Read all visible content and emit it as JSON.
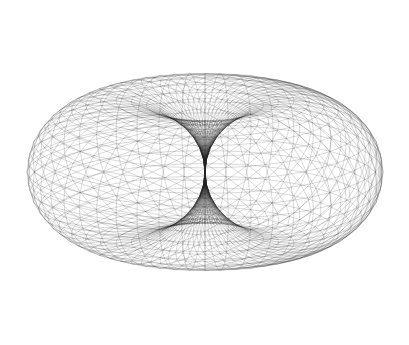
{
  "image": {
    "subject": "horn torus wireframe mesh",
    "background": "#ffffff",
    "line_color": "#222222",
    "width": 409,
    "height": 345
  },
  "mesh": {
    "center_x": 205,
    "center_y": 172,
    "scale_x": 89,
    "scale_y": 75,
    "tube_radius": 1.0,
    "major_radius": 1.0,
    "tilt_deg": 0,
    "u_segments": 48,
    "v_segments": 36,
    "line_opacity": 0.35,
    "line_width": 0.5
  }
}
